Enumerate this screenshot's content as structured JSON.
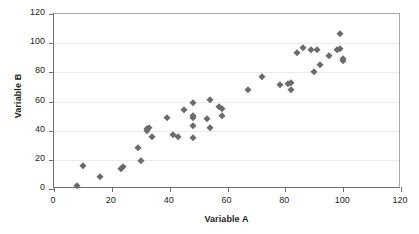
{
  "chart_data": {
    "type": "scatter",
    "title": "",
    "xlabel": "Variable A",
    "ylabel": "Variable B",
    "xlim": [
      0,
      120
    ],
    "ylim": [
      0,
      120
    ],
    "xticks": [
      0,
      20,
      40,
      60,
      80,
      100,
      120
    ],
    "yticks": [
      0,
      20,
      40,
      60,
      80,
      100,
      120
    ],
    "grid": "horizontal",
    "legend": "none",
    "marker": {
      "shape": "diamond",
      "color": "#6b6b6b",
      "size": 5
    },
    "points": [
      {
        "x": 8,
        "y": 2
      },
      {
        "x": 10,
        "y": 16
      },
      {
        "x": 16,
        "y": 8
      },
      {
        "x": 23,
        "y": 14
      },
      {
        "x": 24,
        "y": 15
      },
      {
        "x": 29,
        "y": 28
      },
      {
        "x": 30,
        "y": 19
      },
      {
        "x": 32,
        "y": 41
      },
      {
        "x": 32,
        "y": 40
      },
      {
        "x": 33,
        "y": 42
      },
      {
        "x": 34,
        "y": 36
      },
      {
        "x": 39,
        "y": 49
      },
      {
        "x": 41,
        "y": 37
      },
      {
        "x": 43,
        "y": 36
      },
      {
        "x": 45,
        "y": 54
      },
      {
        "x": 48,
        "y": 59
      },
      {
        "x": 48,
        "y": 50
      },
      {
        "x": 48,
        "y": 49
      },
      {
        "x": 48,
        "y": 43
      },
      {
        "x": 48,
        "y": 35
      },
      {
        "x": 53,
        "y": 48
      },
      {
        "x": 54,
        "y": 61
      },
      {
        "x": 54,
        "y": 42
      },
      {
        "x": 57,
        "y": 56
      },
      {
        "x": 58,
        "y": 55
      },
      {
        "x": 58,
        "y": 50
      },
      {
        "x": 67,
        "y": 68
      },
      {
        "x": 72,
        "y": 77
      },
      {
        "x": 78,
        "y": 71
      },
      {
        "x": 81,
        "y": 72
      },
      {
        "x": 82,
        "y": 73
      },
      {
        "x": 82,
        "y": 68
      },
      {
        "x": 84,
        "y": 93
      },
      {
        "x": 86,
        "y": 97
      },
      {
        "x": 89,
        "y": 95
      },
      {
        "x": 90,
        "y": 80
      },
      {
        "x": 91,
        "y": 95
      },
      {
        "x": 92,
        "y": 85
      },
      {
        "x": 95,
        "y": 91
      },
      {
        "x": 98,
        "y": 95
      },
      {
        "x": 99,
        "y": 106
      },
      {
        "x": 99,
        "y": 96
      },
      {
        "x": 100,
        "y": 89
      },
      {
        "x": 100,
        "y": 88
      }
    ]
  }
}
